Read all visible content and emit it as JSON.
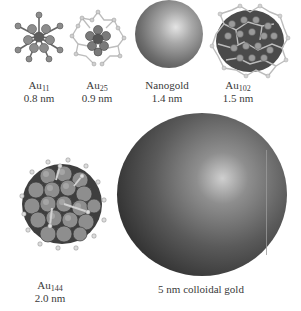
{
  "figure": {
    "items": [
      {
        "id": "au11",
        "element": "Au",
        "subscript": "11",
        "size": "0.8 nm",
        "type": "cluster",
        "label_x": 39,
        "label_y": 80
      },
      {
        "id": "au25",
        "element": "Au",
        "subscript": "25",
        "size": "0.9 nm",
        "type": "cluster",
        "label_x": 97,
        "label_y": 80
      },
      {
        "id": "nanogold",
        "name": "Nanogold",
        "size": "1.4 nm",
        "type": "sphere",
        "label_x": 167,
        "label_y": 80
      },
      {
        "id": "au102",
        "element": "Au",
        "subscript": "102",
        "size": "1.5 nm",
        "type": "cluster",
        "label_x": 238,
        "label_y": 80
      },
      {
        "id": "au144",
        "element": "Au",
        "subscript": "144",
        "size": "2.0 nm",
        "type": "cluster",
        "label_x": 50,
        "label_y": 280
      },
      {
        "id": "colloidal",
        "name": "5 nm colloidal gold",
        "type": "sphere",
        "label_x": 201,
        "label_y": 284
      }
    ],
    "colors": {
      "sphere_highlight": "#d8d8d8",
      "sphere_mid": "#7a7a7a",
      "sphere_shadow": "#1e1e1e",
      "atom": "#8a8a8a",
      "ligand": "#c8c8c8",
      "background": "#ffffff"
    }
  }
}
